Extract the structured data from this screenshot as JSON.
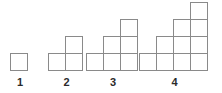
{
  "diagram": {
    "type": "pattern-sequence",
    "background_color": "#ffffff",
    "cell_stroke_color": "#8a8a8a",
    "cell_fill_color": "#ffffff",
    "label_color": "#2b2b2b",
    "cell_size_px": 17,
    "stroke_width_px": 1,
    "baseline_y_px": 71,
    "figures": [
      {
        "label": "1",
        "term_number": 1,
        "rows_bottom_to_top": [
          1
        ],
        "total_squares": 1,
        "left_px": 11,
        "width_cells": 1,
        "height_cells": 1,
        "label_left_px": 11,
        "label_width_px": 18
      },
      {
        "label": "2",
        "term_number": 2,
        "rows_bottom_to_top": [
          2,
          1
        ],
        "total_squares": 3,
        "left_px": 49,
        "width_cells": 2,
        "height_cells": 2,
        "label_left_px": 49,
        "label_width_px": 35
      },
      {
        "label": "3",
        "term_number": 3,
        "rows_bottom_to_top": [
          3,
          2,
          1
        ],
        "total_squares": 6,
        "left_px": 87,
        "width_cells": 3,
        "height_cells": 3,
        "label_left_px": 87,
        "label_width_px": 52
      },
      {
        "label": "4",
        "term_number": 4,
        "rows_bottom_to_top": [
          4,
          3,
          2,
          1
        ],
        "total_squares": 10,
        "left_px": 140,
        "width_cells": 4,
        "height_cells": 4,
        "label_left_px": 140,
        "label_width_px": 69
      }
    ]
  }
}
